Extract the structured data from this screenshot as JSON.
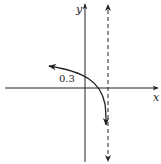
{
  "graph": {
    "axes": {
      "x_label": "x",
      "y_label": "y"
    },
    "annotation": {
      "y_intercept_label": "0.3"
    },
    "asymptote": {
      "type": "vertical",
      "style": "dashed"
    },
    "colors": {
      "stroke": "#222222",
      "background": "#ffffff"
    }
  }
}
